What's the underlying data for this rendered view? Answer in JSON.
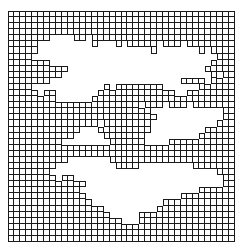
{
  "figure": {
    "type": "grid-mask",
    "cols": 38,
    "rows": 38,
    "line_color": "#1a1a1a",
    "background": "#ffffff",
    "mask": [
      "11111111111111111111111111111111111111",
      "11111111111111111111111111111111111111",
      "11111111111111111111111111111111111111",
      "11111111111111111111111111111111111111",
      "11111110000110111111111111111111111111",
      "11111000000000100010111110111011111111",
      "11111000000000000000000010000000101111",
      "11110000000000000000000000000000000111",
      "11111110000000000000000000000000001111",
      "11111111110000000000000000000000011111",
      "11111111100000000000000000000000001011",
      "11111110000000000000000000000111101111",
      "11110000000000001011111111000000111111",
      "11111011000000011111111111110011111111",
      "11111111000000111111111111111111111111",
      "11111111111111111111110111011101111111",
      "11111111111111111111111100000000000011",
      "11111111111111111111111110000000000011",
      "11111111111111101111111100000000000111",
      "11111111111100011111111100000000011111",
      "11111111111000001111111000000000111111",
      "11111111100000000111111000011111111111",
      "11111111111111111111111111111111111111",
      "11111111111111111111111111111111111111",
      "11111111110000000111111111111111111111",
      "11111111000000000011110000000001111111",
      "11111110000000000000000000000000000111",
      "11111111011000000000000000000000000011",
      "11111111111110000000000000000000000011",
      "11111111111100000000000000000000111111",
      "11111111111110000000000000000111111111",
      "11111111111111000000000000111111111111",
      "11111111111111110000000001111111111111",
      "11111111111111111000001111111111111111",
      "11111111111111111110001111111111111111",
      "11111111111111111111111111111111111111",
      "11111111111111111111111111111111111111",
      "11111111111111111111111111111111111111"
    ]
  }
}
